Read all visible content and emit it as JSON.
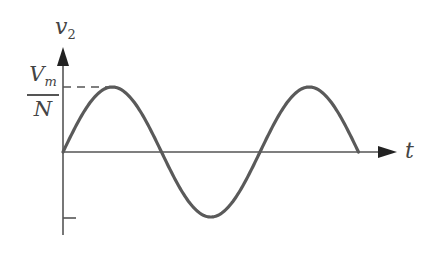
{
  "diagram": {
    "y_axis_label": "v",
    "y_axis_subscript": "2",
    "x_axis_label": "t",
    "peak_label_numerator": "V",
    "peak_label_numerator_sub": "m",
    "peak_label_denominator": "N",
    "waveform": "sine",
    "cycles": 1.5,
    "colors": {
      "curve": "#5a5a5a",
      "axis": "#555555",
      "background": "#ffffff"
    }
  }
}
